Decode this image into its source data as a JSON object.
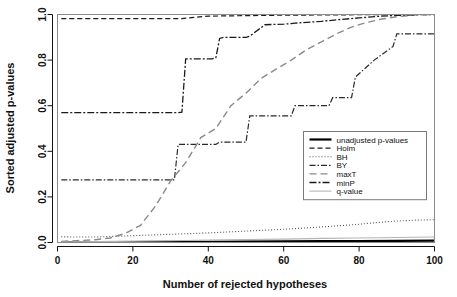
{
  "chart_data": {
    "type": "line",
    "title": "",
    "xlabel": "Number of rejected hypotheses",
    "ylabel": "Sorted adjusted p-values",
    "xlim": [
      0,
      100
    ],
    "ylim": [
      0.0,
      1.0
    ],
    "xticks": [
      0,
      20,
      40,
      60,
      80,
      100
    ],
    "xtick_labels": [
      "0",
      "20",
      "40",
      "60",
      "80",
      "100"
    ],
    "yticks": [
      0.0,
      0.2,
      0.4,
      0.6,
      0.8,
      1.0
    ],
    "ytick_labels": [
      "0.0",
      "0.2",
      "0.4",
      "0.6",
      "0.8",
      "1.0"
    ],
    "grid": false,
    "legend_position": "center-right",
    "series": [
      {
        "name": "unadjusted p-values",
        "style": "solid",
        "color": "#000000",
        "width": 2.2,
        "dash": "",
        "x": [
          1,
          5,
          10,
          20,
          30,
          40,
          50,
          60,
          70,
          80,
          90,
          100
        ],
        "values": [
          0.0002,
          0.0006,
          0.0011,
          0.0019,
          0.0026,
          0.0033,
          0.0041,
          0.0048,
          0.0056,
          0.0064,
          0.0072,
          0.008
        ]
      },
      {
        "name": "Holm",
        "style": "dashed",
        "color": "#1a1a1a",
        "width": 1.2,
        "dash": "5,3",
        "x": [
          1,
          10,
          20,
          30,
          33,
          40,
          50,
          55,
          60,
          70,
          80,
          90,
          95,
          100
        ],
        "values": [
          0.982,
          0.982,
          0.982,
          0.982,
          0.982,
          0.993,
          0.995,
          0.996,
          0.997,
          0.998,
          0.999,
          1.0,
          1.0,
          1.0
        ]
      },
      {
        "name": "BH",
        "style": "dotted",
        "color": "#555555",
        "width": 1.1,
        "dash": "1,2",
        "x": [
          1,
          5,
          10,
          20,
          30,
          40,
          50,
          60,
          70,
          75,
          80,
          85,
          90,
          95,
          100
        ],
        "values": [
          0.025,
          0.024,
          0.024,
          0.03,
          0.036,
          0.042,
          0.05,
          0.058,
          0.068,
          0.074,
          0.08,
          0.088,
          0.094,
          0.098,
          0.1
        ]
      },
      {
        "name": "BY",
        "style": "dashdot",
        "color": "#2a2a2a",
        "width": 1.2,
        "dash": "6,2,1.5,2",
        "x": [
          1,
          10,
          20,
          31,
          32,
          42,
          43,
          50,
          51,
          55,
          62,
          63,
          72,
          73,
          78,
          79,
          84,
          89,
          90,
          100
        ],
        "values": [
          0.275,
          0.275,
          0.275,
          0.275,
          0.43,
          0.43,
          0.44,
          0.44,
          0.555,
          0.555,
          0.555,
          0.6,
          0.6,
          0.635,
          0.635,
          0.725,
          0.8,
          0.86,
          0.915,
          0.915
        ]
      },
      {
        "name": "maxT",
        "style": "longdash",
        "color": "#8a8a8a",
        "width": 1.4,
        "dash": "7,4",
        "x": [
          1,
          5,
          10,
          14,
          18,
          22,
          26,
          30,
          34,
          38,
          42,
          46,
          50,
          54,
          58,
          62,
          66,
          70,
          74,
          78,
          82,
          86,
          90,
          95,
          100
        ],
        "values": [
          0.005,
          0.008,
          0.012,
          0.02,
          0.04,
          0.075,
          0.16,
          0.27,
          0.35,
          0.46,
          0.5,
          0.6,
          0.655,
          0.72,
          0.76,
          0.8,
          0.845,
          0.88,
          0.915,
          0.945,
          0.965,
          0.98,
          0.99,
          0.998,
          1.0
        ]
      },
      {
        "name": "minP",
        "style": "dashdot-dark",
        "color": "#1a1a1a",
        "width": 1.3,
        "dash": "7,2,2,2",
        "x": [
          1,
          20,
          32,
          33,
          34,
          41,
          42,
          43,
          44,
          50,
          51,
          55,
          60,
          62,
          63,
          70,
          75,
          80,
          85,
          90,
          95,
          100
        ],
        "values": [
          0.57,
          0.57,
          0.57,
          0.572,
          0.805,
          0.805,
          0.81,
          0.895,
          0.9,
          0.9,
          0.905,
          0.955,
          0.958,
          0.96,
          0.962,
          0.97,
          0.978,
          0.985,
          0.992,
          0.996,
          0.999,
          1.0
        ]
      },
      {
        "name": "q-value",
        "style": "solid-light",
        "color": "#b5b5b5",
        "width": 1.1,
        "dash": "",
        "x": [
          1,
          5,
          10,
          20,
          30,
          40,
          50,
          60,
          70,
          80,
          90,
          100
        ],
        "values": [
          0.002,
          0.003,
          0.004,
          0.006,
          0.008,
          0.011,
          0.013,
          0.015,
          0.018,
          0.02,
          0.022,
          0.024
        ]
      }
    ]
  }
}
